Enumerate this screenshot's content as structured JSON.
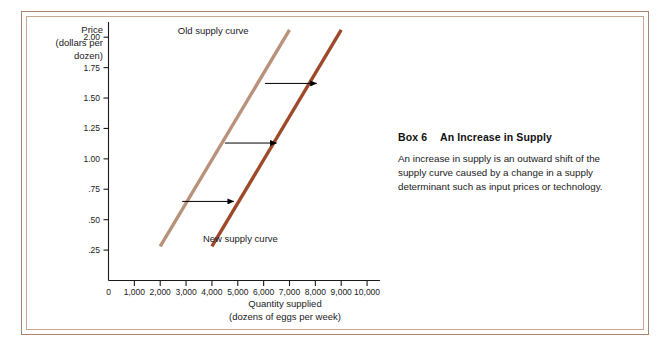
{
  "figure": {
    "frame_color_outer": "#a8846f",
    "frame_color_inner": "#c8a894"
  },
  "caption": {
    "box_number": "Box 6",
    "title": "An Increase in Supply",
    "body": "An increase in supply is an outward shift of the supply curve caused by a change in a supply determinant such as input prices or technology."
  },
  "chart_data": {
    "type": "line",
    "title": "An Increase in Supply",
    "xlabel": "Quantity supplied",
    "xlabel_sub": "(dozens of eggs per week)",
    "ylabel": "Price",
    "ylabel_sub1": "(dollars per",
    "ylabel_sub2": "dozen)",
    "xlim": [
      0,
      10500
    ],
    "ylim": [
      0,
      2.125
    ],
    "grid": false,
    "legend_position": "inline-labels",
    "xticks": [
      0,
      1000,
      2000,
      3000,
      4000,
      5000,
      6000,
      7000,
      8000,
      9000,
      10000
    ],
    "xticklabels": [
      "0",
      "1,000",
      "2,000",
      "3,000",
      "4,000",
      "5,000",
      "6,000",
      "7,000",
      "8,000",
      "9,000",
      "10,000"
    ],
    "yticks": [
      0.25,
      0.5,
      0.75,
      1.0,
      1.25,
      1.5,
      1.75,
      2.0
    ],
    "yticklabels": [
      ".25",
      ".50",
      ".75",
      "1.00",
      "1.25",
      "1.50",
      "1.75",
      "2.00"
    ],
    "series": [
      {
        "name": "Old supply curve",
        "color": "#b9927b",
        "x": [
          2000,
          7000
        ],
        "y": [
          0.28,
          2.06
        ],
        "label": "Old supply curve",
        "label_x": 4050,
        "label_y": 2.03
      },
      {
        "name": "New supply curve",
        "color": "#9e4a2a",
        "x": [
          4000,
          9000
        ],
        "y": [
          0.28,
          2.06
        ],
        "label": "New supply curve",
        "label_x": 5100,
        "label_y": 0.32
      }
    ],
    "annotations": [
      {
        "type": "arrow",
        "label": "shift-arrow-low",
        "x_start": 2850,
        "x_end": 4850,
        "y": 0.65
      },
      {
        "type": "arrow",
        "label": "shift-arrow-mid",
        "x_start": 4500,
        "x_end": 6500,
        "y": 1.13
      },
      {
        "type": "arrow",
        "label": "shift-arrow-high",
        "x_start": 6050,
        "x_end": 8050,
        "y": 1.62
      }
    ]
  }
}
